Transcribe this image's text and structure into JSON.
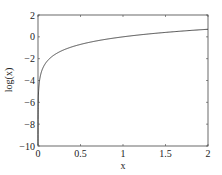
{
  "chart_data": {
    "type": "line",
    "title": "",
    "xlabel": "x",
    "ylabel": "log(x)",
    "xlim": [
      0,
      2
    ],
    "ylim": [
      -10,
      2
    ],
    "xticks": [
      0,
      0.5,
      1,
      1.5,
      2
    ],
    "xtick_labels": [
      "0",
      "0.5",
      "1",
      "1.5",
      "2"
    ],
    "yticks": [
      -10,
      -8,
      -6,
      -4,
      -2,
      0,
      2
    ],
    "ytick_labels": [
      "-10",
      "-8",
      "-6",
      "-4",
      "-2",
      "0",
      "2"
    ],
    "grid": false,
    "legend": null,
    "series": [
      {
        "name": "log(x)",
        "x": [
          0.0001,
          0.001,
          0.01,
          0.02,
          0.05,
          0.1,
          0.2,
          0.3,
          0.5,
          0.75,
          1.0,
          1.25,
          1.5,
          1.75,
          2.0
        ],
        "values": [
          -9.21,
          -6.91,
          -4.61,
          -3.91,
          -3.0,
          -2.3,
          -1.61,
          -1.2,
          -0.69,
          -0.29,
          0.0,
          0.22,
          0.41,
          0.56,
          0.69
        ]
      }
    ],
    "color": "#333333"
  }
}
